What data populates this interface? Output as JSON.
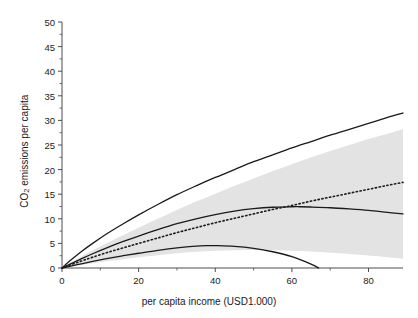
{
  "chart_data": {
    "type": "line",
    "title": "",
    "xlabel": "per capita income (USD1.000)",
    "ylabel_prefix": "CO",
    "ylabel_sub": "2",
    "ylabel_suffix": " emissions per capita",
    "ylabel": "CO2 emissions per capita",
    "xlim": [
      0,
      89
    ],
    "ylim": [
      0,
      50
    ],
    "xticks": [
      0,
      20,
      40,
      60,
      80
    ],
    "xtick_labels": [
      "0",
      "20",
      "40",
      "60",
      "80"
    ],
    "yticks": [
      0,
      5,
      10,
      15,
      20,
      25,
      30,
      35,
      40,
      45,
      50
    ],
    "ytick_labels": [
      "0",
      "5",
      "10",
      "15",
      "20",
      "25",
      "30",
      "35",
      "40",
      "45",
      "50"
    ],
    "xminor_step": 10,
    "yminor_step": 2.5,
    "grid": false,
    "legend": "none",
    "band_color": "#e3e3e3",
    "line_color": "#1a1a1a",
    "series": [
      {
        "name": "upper-solid-curve",
        "style": "solid",
        "x": [
          0,
          2,
          5,
          8,
          12,
          16,
          20,
          25,
          30,
          35,
          40,
          45,
          50,
          55,
          60,
          65,
          70,
          75,
          80,
          85,
          89
        ],
        "values": [
          0,
          1.4,
          3.3,
          5.0,
          7.1,
          9.0,
          10.8,
          12.9,
          14.9,
          16.7,
          18.4,
          20.0,
          21.6,
          23.0,
          24.4,
          25.7,
          27.0,
          28.2,
          29.4,
          30.6,
          31.5
        ]
      },
      {
        "name": "mean-dotted-curve",
        "style": "dotted",
        "x": [
          0,
          2,
          5,
          8,
          12,
          16,
          20,
          25,
          30,
          35,
          40,
          45,
          50,
          55,
          60,
          65,
          70,
          75,
          80,
          85,
          89
        ],
        "values": [
          0,
          0.6,
          1.4,
          2.2,
          3.2,
          4.1,
          5.0,
          6.1,
          7.2,
          8.2,
          9.2,
          10.1,
          11.0,
          11.9,
          12.7,
          13.6,
          14.4,
          15.2,
          16.0,
          16.8,
          17.4
        ]
      },
      {
        "name": "middle-solid-curve",
        "style": "solid",
        "x": [
          0,
          2,
          5,
          8,
          12,
          16,
          20,
          25,
          30,
          35,
          40,
          45,
          50,
          55,
          60,
          62,
          65,
          70,
          75,
          80,
          85,
          89
        ],
        "values": [
          0,
          0.75,
          1.85,
          2.9,
          4.2,
          5.4,
          6.5,
          7.8,
          9.0,
          10.0,
          10.85,
          11.55,
          12.05,
          12.35,
          12.45,
          12.45,
          12.4,
          12.25,
          12.0,
          11.7,
          11.3,
          11.0
        ]
      },
      {
        "name": "lower-solid-curve",
        "style": "solid",
        "x": [
          0,
          2,
          5,
          8,
          12,
          16,
          20,
          25,
          30,
          35,
          38,
          40,
          45,
          50,
          55,
          60,
          65,
          67
        ],
        "values": [
          0,
          0.35,
          0.85,
          1.35,
          1.95,
          2.5,
          3.0,
          3.6,
          4.1,
          4.45,
          4.55,
          4.55,
          4.4,
          4.0,
          3.3,
          2.3,
          0.8,
          0.0
        ]
      }
    ],
    "confidence_band": {
      "name": "confidence-band",
      "x": [
        0,
        2,
        5,
        8,
        12,
        16,
        20,
        25,
        30,
        35,
        40,
        45,
        50,
        55,
        60,
        65,
        70,
        75,
        80,
        85,
        89
      ],
      "upper": [
        0,
        0.95,
        2.3,
        3.6,
        5.2,
        6.7,
        8.2,
        10.0,
        11.8,
        13.5,
        15.1,
        16.7,
        18.2,
        19.7,
        21.1,
        22.5,
        23.8,
        25.0,
        26.2,
        27.3,
        28.2
      ],
      "lower": [
        0,
        0.25,
        0.6,
        0.95,
        1.4,
        1.8,
        2.2,
        2.6,
        3.0,
        3.3,
        3.5,
        3.6,
        3.65,
        3.6,
        3.5,
        3.35,
        3.1,
        2.85,
        2.55,
        2.2,
        1.9
      ]
    }
  }
}
